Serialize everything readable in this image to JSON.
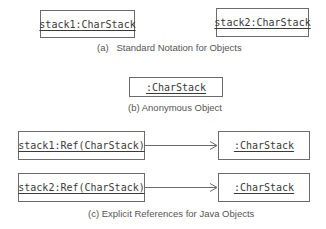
{
  "section_a": {
    "objects": [
      {
        "label": "stack1:CharStack"
      },
      {
        "label": "stack2:CharStack"
      }
    ],
    "caption": "(a)   Standard Notation for Objects"
  },
  "section_b": {
    "object": {
      "label": ":CharStack"
    },
    "caption": "(b) Anonymous Object"
  },
  "section_c": {
    "rows": [
      {
        "ref": "stack1:Ref(CharStack)",
        "target": ":CharStack"
      },
      {
        "ref": "stack2:Ref(CharStack)",
        "target": ":CharStack"
      }
    ],
    "caption": "(c) Explicit References for Java Objects"
  },
  "colors": {
    "stroke": "#6b6b6b",
    "text": "#3a3a3a",
    "caption": "#555555"
  }
}
